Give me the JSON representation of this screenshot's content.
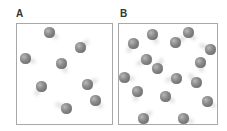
{
  "panels": [
    {
      "label": "A",
      "box": {
        "x": 16,
        "y": 23,
        "w": 97,
        "h": 102
      },
      "balls": [
        [
          49,
          32
        ],
        [
          80,
          47
        ],
        [
          25,
          58
        ],
        [
          61,
          63
        ],
        [
          41,
          86
        ],
        [
          87,
          84
        ],
        [
          95,
          100
        ],
        [
          66,
          108
        ]
      ]
    },
    {
      "label": "B",
      "box": {
        "x": 118,
        "y": 23,
        "w": 100,
        "h": 102
      },
      "balls": [
        [
          152,
          34
        ],
        [
          133,
          43
        ],
        [
          175,
          42
        ],
        [
          188,
          32
        ],
        [
          210,
          49
        ],
        [
          146,
          59
        ],
        [
          157,
          68
        ],
        [
          200,
          62
        ],
        [
          124,
          77
        ],
        [
          176,
          78
        ],
        [
          196,
          82
        ],
        [
          137,
          91
        ],
        [
          165,
          96
        ],
        [
          207,
          101
        ],
        [
          143,
          118
        ],
        [
          183,
          118
        ]
      ]
    }
  ],
  "colors": {
    "border": "#a8a8a8",
    "ball": "#7a7a7a",
    "label": "#333333"
  }
}
